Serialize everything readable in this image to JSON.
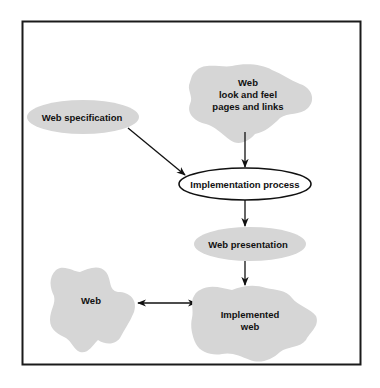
{
  "diagram": {
    "type": "flow-diagram",
    "colors": {
      "frame": "#1a1a1a",
      "node_fill": "#d6d6d6",
      "process_fill": "#ffffff",
      "stroke": "#111111",
      "text": "#111111",
      "background": "#ffffff"
    },
    "nodes": {
      "look_and_feel": {
        "shape": "cloud",
        "lines": [
          "Web",
          "look and feel",
          "pages and links"
        ]
      },
      "web_specification": {
        "shape": "ellipse",
        "label": "Web specification"
      },
      "implementation_process": {
        "shape": "ellipse-outlined",
        "label": "Implementation process"
      },
      "web_presentation": {
        "shape": "ellipse",
        "label": "Web presentation"
      },
      "web": {
        "shape": "cloud",
        "label": "Web"
      },
      "implemented_web": {
        "shape": "cloud",
        "lines": [
          "Implemented",
          "web"
        ]
      }
    },
    "edges": [
      {
        "from": "Web specification",
        "to": "Implementation process",
        "direction": "forward"
      },
      {
        "from": "Web look and feel pages and links",
        "to": "Implementation process",
        "direction": "forward"
      },
      {
        "from": "Implementation process",
        "to": "Web presentation",
        "direction": "forward"
      },
      {
        "from": "Web presentation",
        "to": "Implemented web",
        "direction": "forward"
      },
      {
        "from": "Web",
        "to": "Implemented web",
        "direction": "both"
      }
    ]
  }
}
